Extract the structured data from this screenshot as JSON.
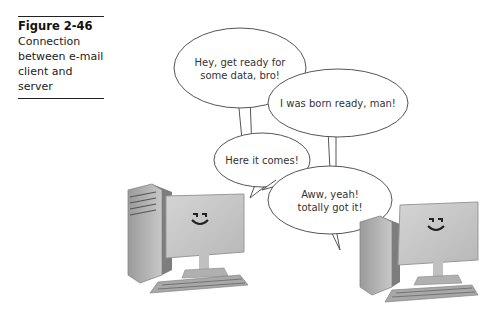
{
  "caption": {
    "figure_label": "Figure 2-46",
    "description": "Connection between e-mail client and server"
  },
  "bubbles": [
    {
      "speaker": "client",
      "line1": "Hey, get ready for",
      "line2": "some data, bro!"
    },
    {
      "speaker": "server",
      "line1": "I was born ready, man!",
      "line2": ""
    },
    {
      "speaker": "client",
      "line1": "Here it comes!",
      "line2": ""
    },
    {
      "speaker": "server",
      "line1": "Aww, yeah!",
      "line2": "totally got it!"
    }
  ],
  "computers": [
    {
      "role": "client",
      "face": "smiley"
    },
    {
      "role": "server",
      "face": "smiley"
    }
  ]
}
